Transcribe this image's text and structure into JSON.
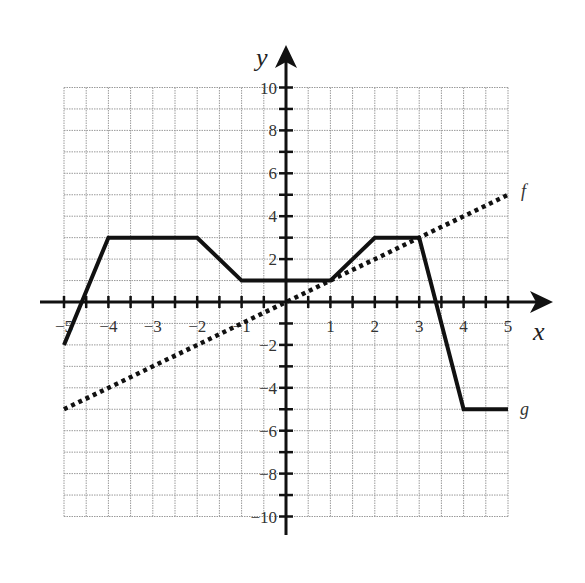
{
  "chart_data": {
    "type": "line",
    "title": "",
    "xlabel": "x",
    "ylabel": "y",
    "xlim": [
      -5,
      5
    ],
    "ylim": [
      -10,
      10
    ],
    "grid": true,
    "grid_step": {
      "x": 0.5,
      "y": 1
    },
    "x_ticks": [
      -5,
      -4,
      -3,
      -2,
      -1,
      1,
      2,
      3,
      4,
      5
    ],
    "x_tick_labels": [
      "−5",
      "−4",
      "−3",
      "−2",
      "−1",
      "1",
      "2",
      "3",
      "4",
      "5"
    ],
    "y_ticks": [
      -10,
      -8,
      -6,
      -4,
      -2,
      2,
      4,
      6,
      8,
      10
    ],
    "y_tick_labels": [
      "−10",
      "−8",
      "−6",
      "−4",
      "−2",
      "2",
      "4",
      "6",
      "8",
      "10"
    ],
    "legend": "inline labels at line ends",
    "series": [
      {
        "name": "f",
        "style": "dotted",
        "color": "#111111",
        "points": [
          [
            -5,
            -5
          ],
          [
            5,
            5
          ]
        ]
      },
      {
        "name": "g",
        "style": "solid",
        "color": "#111111",
        "points": [
          [
            -5,
            -2
          ],
          [
            -4,
            3
          ],
          [
            -2,
            3
          ],
          [
            -1,
            1
          ],
          [
            1,
            1
          ],
          [
            2,
            3
          ],
          [
            3,
            3
          ],
          [
            4,
            -5
          ],
          [
            5,
            -5
          ]
        ]
      }
    ]
  },
  "labels": {
    "x_axis": "x",
    "y_axis": "y",
    "f_label": "f",
    "g_label": "g"
  },
  "colors": {
    "grid": "#9a9a9a",
    "axis": "#111111",
    "line": "#111111"
  }
}
